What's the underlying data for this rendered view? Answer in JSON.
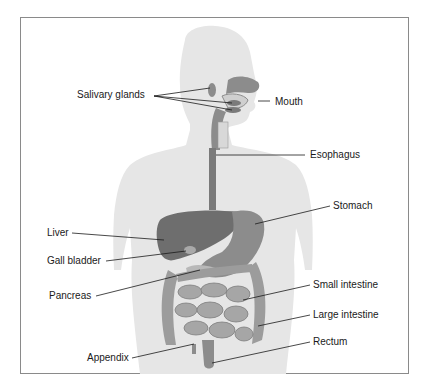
{
  "diagram": {
    "colors": {
      "silhouette": "#e6e6e6",
      "organ_dark": "#6e6e6e",
      "organ_mid": "#8c8c8c",
      "organ_light": "#a9a9a9",
      "frame": "#8a8a8a",
      "leader": "#1a1a1a"
    },
    "labels": {
      "salivary_glands": "Salivary glands",
      "mouth": "Mouth",
      "esophagus": "Esophagus",
      "stomach": "Stomach",
      "liver": "Liver",
      "gall_bladder": "Gall bladder",
      "pancreas": "Pancreas",
      "small_intestine": "Small intestine",
      "large_intestine": "Large intestine",
      "appendix": "Appendix",
      "rectum": "Rectum"
    }
  }
}
